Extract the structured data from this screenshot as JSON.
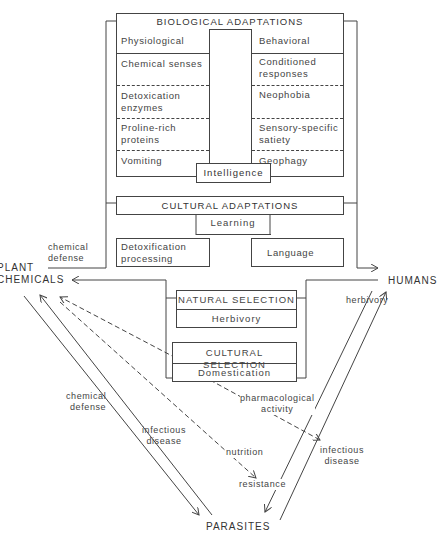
{
  "biological_adaptations": {
    "title": "BIOLOGICAL ADAPTATIONS",
    "physiological": {
      "header": "Physiological",
      "items": [
        "Chemical senses",
        "Detoxication enzymes",
        "Proline-rich proteins",
        "Vomiting"
      ]
    },
    "behavioral": {
      "header": "Behavioral",
      "items": [
        "Conditioned responses",
        "Neophobia",
        "Sensory-specific satiety",
        "Geophagy"
      ]
    },
    "intelligence": "Intelligence"
  },
  "cultural_adaptations": {
    "title": "CULTURAL ADAPTATIONS",
    "learning": "Learning",
    "detoxification": "Detoxification processing",
    "language": "Language"
  },
  "natural_selection": {
    "title": "NATURAL SELECTION",
    "item": "Herbivory"
  },
  "cultural_selection": {
    "title": "CULTURAL SELECTION",
    "item": "Domestication"
  },
  "nodes": {
    "plant_chemicals_1": "PLANT",
    "plant_chemicals_2": "CHEMICALS",
    "humans": "HUMANS",
    "parasites": "PARASITES"
  },
  "edge_labels": {
    "chemical_defense_top_1": "chemical",
    "chemical_defense_top_2": "defense",
    "herbivory": "herbivory",
    "chemical_defense_left_1": "chemical",
    "chemical_defense_left_2": "defense",
    "infectious_disease_left_1": "infectious",
    "infectious_disease_left_2": "disease",
    "pharmacological_1": "pharmacological",
    "pharmacological_2": "activity",
    "nutrition": "nutrition",
    "resistance": "resistance",
    "infectious_disease_right_1": "infectious",
    "infectious_disease_right_2": "disease"
  },
  "colors": {
    "line": "#444444",
    "text": "#444444",
    "background": "#ffffff"
  }
}
